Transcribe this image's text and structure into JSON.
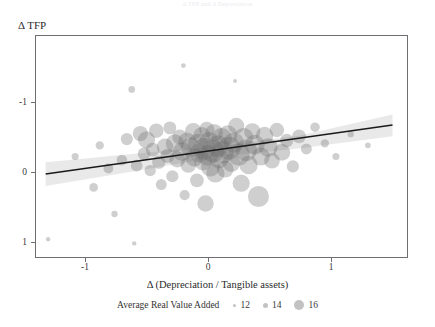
{
  "caption": {
    "text": "Δ TFP and Δ Depreciation"
  },
  "axes": {
    "y_title": "Δ TFP",
    "x_title": "Δ (Depreciation / Tangible assets)",
    "y_ticks": [
      "1",
      "0",
      "-1"
    ],
    "x_ticks": [
      "-1",
      "0",
      "1"
    ]
  },
  "legend": {
    "title": "Average Real Value Added",
    "items": [
      {
        "label": "12",
        "size": 3
      },
      {
        "label": "14",
        "size": 5
      },
      {
        "label": "16",
        "size": 10
      }
    ]
  },
  "colors": {
    "bubble": "#6e6e6e",
    "line": "#1a1a1a",
    "band": "#c9c9c9",
    "frame": "#6f6f73",
    "text": "#2b2b2b"
  },
  "chart_data": {
    "type": "scatter",
    "title": "",
    "xlabel": "Δ (Depreciation / Tangible assets)",
    "ylabel": "Δ TFP",
    "xlim": [
      -1.41,
      1.63
    ],
    "ylim": [
      -1.41,
      1.76
    ],
    "xticks": [
      -1,
      0,
      1
    ],
    "yticks": [
      -1,
      0,
      1
    ],
    "grid": false,
    "legend_position": "bottom",
    "size_legend": {
      "title": "Average Real Value Added",
      "breaks": [
        12,
        14,
        16
      ]
    },
    "regression_line": {
      "x": [
        -1.32,
        1.5
      ],
      "y": [
        -0.03,
        0.67
      ],
      "slope": 0.248,
      "intercept": 0.298,
      "color": "#1a1a1a"
    },
    "confidence_band": {
      "x": [
        -1.32,
        -0.6,
        0.1,
        0.75,
        1.5
      ],
      "upper": [
        0.14,
        0.26,
        0.38,
        0.52,
        0.82
      ],
      "lower": [
        -0.2,
        0.01,
        0.22,
        0.34,
        0.51
      ],
      "color": "#c9c9c9"
    },
    "points": [
      {
        "x": -1.3,
        "y": -0.96,
        "size": 11.5
      },
      {
        "x": -1.08,
        "y": 0.22,
        "size": 12.2
      },
      {
        "x": -0.93,
        "y": -0.22,
        "size": 12.6
      },
      {
        "x": -0.88,
        "y": 0.38,
        "size": 12.5
      },
      {
        "x": -0.81,
        "y": 0.05,
        "size": 12.9
      },
      {
        "x": -0.76,
        "y": -0.6,
        "size": 12.0
      },
      {
        "x": -0.7,
        "y": 0.17,
        "size": 13.1
      },
      {
        "x": -0.66,
        "y": 0.47,
        "size": 13.5
      },
      {
        "x": -0.62,
        "y": 1.18,
        "size": 12.1
      },
      {
        "x": -0.58,
        "y": 0.09,
        "size": 13.4
      },
      {
        "x": -0.55,
        "y": 0.55,
        "size": 14.3
      },
      {
        "x": -0.52,
        "y": 0.26,
        "size": 13.6
      },
      {
        "x": -0.5,
        "y": 0.46,
        "size": 14.8
      },
      {
        "x": -0.47,
        "y": 0.02,
        "size": 13.3
      },
      {
        "x": -0.45,
        "y": 0.32,
        "size": 13.9
      },
      {
        "x": -0.42,
        "y": 0.59,
        "size": 14.1
      },
      {
        "x": -0.4,
        "y": 0.14,
        "size": 13.8
      },
      {
        "x": -0.38,
        "y": -0.18,
        "size": 13.2
      },
      {
        "x": -0.35,
        "y": 0.36,
        "size": 14.6
      },
      {
        "x": -0.33,
        "y": 0.23,
        "size": 14.0
      },
      {
        "x": -0.31,
        "y": 0.63,
        "size": 13.7
      },
      {
        "x": -0.29,
        "y": -0.06,
        "size": 13.5
      },
      {
        "x": -0.27,
        "y": 0.41,
        "size": 15.0
      },
      {
        "x": -0.25,
        "y": 0.18,
        "size": 14.5
      },
      {
        "x": -0.23,
        "y": 0.5,
        "size": 14.2
      },
      {
        "x": -0.21,
        "y": 0.29,
        "size": 15.2
      },
      {
        "x": -0.19,
        "y": -0.33,
        "size": 13.0
      },
      {
        "x": -0.17,
        "y": 0.44,
        "size": 14.9
      },
      {
        "x": -0.16,
        "y": 0.1,
        "size": 14.4
      },
      {
        "x": -0.14,
        "y": 0.35,
        "size": 15.4
      },
      {
        "x": -0.12,
        "y": 0.58,
        "size": 14.7
      },
      {
        "x": -0.11,
        "y": 0.21,
        "size": 15.1
      },
      {
        "x": -0.09,
        "y": -0.12,
        "size": 13.9
      },
      {
        "x": -0.08,
        "y": 0.4,
        "size": 15.6
      },
      {
        "x": -0.07,
        "y": 0.27,
        "size": 15.3
      },
      {
        "x": -0.05,
        "y": 0.52,
        "size": 14.8
      },
      {
        "x": -0.04,
        "y": 0.15,
        "size": 15.0
      },
      {
        "x": -0.03,
        "y": 0.33,
        "size": 16.0
      },
      {
        "x": -0.02,
        "y": -0.45,
        "size": 14.6
      },
      {
        "x": -0.01,
        "y": 0.61,
        "size": 14.3
      },
      {
        "x": 0.0,
        "y": 0.24,
        "size": 15.8
      },
      {
        "x": 0.01,
        "y": 0.43,
        "size": 15.5
      },
      {
        "x": 0.02,
        "y": 0.07,
        "size": 15.2
      },
      {
        "x": 0.04,
        "y": 0.3,
        "size": 16.2
      },
      {
        "x": 0.05,
        "y": 0.56,
        "size": 14.9
      },
      {
        "x": 0.06,
        "y": -0.02,
        "size": 15.1
      },
      {
        "x": 0.08,
        "y": 0.37,
        "size": 15.9
      },
      {
        "x": 0.09,
        "y": 0.19,
        "size": 15.4
      },
      {
        "x": 0.11,
        "y": 0.48,
        "size": 15.7
      },
      {
        "x": 0.12,
        "y": 0.28,
        "size": 16.1
      },
      {
        "x": 0.14,
        "y": 0.04,
        "size": 14.7
      },
      {
        "x": 0.16,
        "y": 0.53,
        "size": 15.3
      },
      {
        "x": 0.17,
        "y": 0.34,
        "size": 16.3
      },
      {
        "x": 0.19,
        "y": 0.13,
        "size": 15.0
      },
      {
        "x": 0.21,
        "y": 0.42,
        "size": 15.6
      },
      {
        "x": 0.23,
        "y": 0.66,
        "size": 14.5
      },
      {
        "x": 0.25,
        "y": 0.25,
        "size": 16.0
      },
      {
        "x": 0.27,
        "y": -0.16,
        "size": 14.8
      },
      {
        "x": 0.29,
        "y": 0.49,
        "size": 15.4
      },
      {
        "x": 0.31,
        "y": 0.31,
        "size": 15.9
      },
      {
        "x": 0.33,
        "y": 0.1,
        "size": 15.1
      },
      {
        "x": 0.36,
        "y": 0.58,
        "size": 14.6
      },
      {
        "x": 0.38,
        "y": 0.39,
        "size": 15.5
      },
      {
        "x": 0.41,
        "y": -0.35,
        "size": 15.8
      },
      {
        "x": 0.43,
        "y": 0.22,
        "size": 15.0
      },
      {
        "x": 0.46,
        "y": 0.52,
        "size": 14.9
      },
      {
        "x": 0.49,
        "y": 0.35,
        "size": 15.2
      },
      {
        "x": 0.52,
        "y": 0.16,
        "size": 14.4
      },
      {
        "x": 0.56,
        "y": 0.6,
        "size": 14.1
      },
      {
        "x": 0.6,
        "y": 0.28,
        "size": 14.7
      },
      {
        "x": 0.64,
        "y": 0.45,
        "size": 13.8
      },
      {
        "x": 0.69,
        "y": 0.08,
        "size": 13.5
      },
      {
        "x": 0.74,
        "y": 0.51,
        "size": 13.9
      },
      {
        "x": 0.8,
        "y": 0.33,
        "size": 13.2
      },
      {
        "x": 0.87,
        "y": 0.64,
        "size": 12.8
      },
      {
        "x": 0.95,
        "y": 0.41,
        "size": 12.5
      },
      {
        "x": 1.04,
        "y": 0.22,
        "size": 12.2
      },
      {
        "x": 1.16,
        "y": 0.54,
        "size": 12.0
      },
      {
        "x": 1.3,
        "y": 0.38,
        "size": 11.8
      },
      {
        "x": -0.2,
        "y": 1.52,
        "size": 11.6
      },
      {
        "x": 0.22,
        "y": 1.3,
        "size": 11.4
      },
      {
        "x": -0.6,
        "y": -1.02,
        "size": 11.5
      }
    ]
  }
}
